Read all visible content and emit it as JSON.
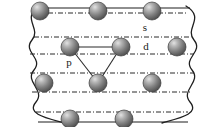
{
  "figure": {
    "background_color": "#ffffff",
    "width": 216,
    "height": 127
  },
  "labels": {
    "s": "s",
    "p": "p",
    "d": "d"
  },
  "label_positions": {
    "s": {
      "x": 145,
      "y": 31
    },
    "p": {
      "x": 69,
      "y": 66
    },
    "d": {
      "x": 146,
      "y": 50
    }
  },
  "colors": {
    "sphere_dark": "#4a4a4a",
    "sphere_mid": "#7d7d7d",
    "sphere_light": "#c8c8c8",
    "sphere_highlight": "#e2e2e2",
    "sphere_outline": "#3c3c3c",
    "level_line": "#2b2b2b",
    "boundary_line": "#1f1f1f",
    "bond_line": "#2b2b2b",
    "label_text": "#1a1a1a"
  },
  "lattice_rows": [
    {
      "name": "row-top",
      "y": 11,
      "spheres": [
        {
          "cx": 40,
          "cy": 11,
          "r": 9
        },
        {
          "cx": 98,
          "cy": 11,
          "r": 9
        },
        {
          "cx": 152,
          "cy": 11,
          "r": 9
        }
      ]
    },
    {
      "name": "row-second",
      "y": 47,
      "spheres": [
        {
          "cx": 70,
          "cy": 47,
          "r": 9
        },
        {
          "cx": 121,
          "cy": 47,
          "r": 9
        },
        {
          "cx": 177,
          "cy": 47,
          "r": 9
        }
      ]
    },
    {
      "name": "row-third",
      "y": 83,
      "spheres": [
        {
          "cx": 44,
          "cy": 83,
          "r": 9
        },
        {
          "cx": 98,
          "cy": 83,
          "r": 9
        },
        {
          "cx": 152,
          "cy": 83,
          "r": 9
        }
      ]
    },
    {
      "name": "row-bottom",
      "y": 119,
      "spheres": [
        {
          "cx": 70,
          "cy": 119,
          "r": 9
        },
        {
          "cx": 124,
          "cy": 119,
          "r": 9
        }
      ]
    }
  ],
  "energy_levels": [
    {
      "name": "level-1",
      "y": 13,
      "x1": 38,
      "x2": 186,
      "style": "dash-dot"
    },
    {
      "name": "level-2",
      "y": 37,
      "x1": 34,
      "x2": 190,
      "style": "dash-dot"
    },
    {
      "name": "level-3",
      "y": 54,
      "x1": 30,
      "x2": 194,
      "style": "dash-dot"
    },
    {
      "name": "level-4",
      "y": 73,
      "x1": 30,
      "x2": 194,
      "style": "dash-dot"
    },
    {
      "name": "level-5",
      "y": 92,
      "x1": 32,
      "x2": 192,
      "style": "dash-dot"
    },
    {
      "name": "level-6",
      "y": 112,
      "x1": 36,
      "x2": 188,
      "style": "dash-dot"
    }
  ],
  "solid_edges": [
    {
      "name": "edge-top",
      "y": 8,
      "x1": 36,
      "x2": 190
    },
    {
      "name": "edge-bottom",
      "y": 122,
      "x1": 38,
      "x2": 188
    }
  ],
  "bonds": [
    {
      "name": "bond-d-horizontal",
      "x1": 70,
      "y1": 47,
      "x2": 121,
      "y2": 47
    },
    {
      "name": "bond-left-diagonal",
      "x1": 70,
      "y1": 47,
      "x2": 98,
      "y2": 83
    },
    {
      "name": "bond-right-diagonal",
      "x1": 121,
      "y1": 47,
      "x2": 98,
      "y2": 83
    }
  ],
  "boundaries": [
    {
      "name": "left-wave",
      "path": "M 40 6 C 20 18, 42 28, 32 40 C 22 52, 44 58, 34 70 C 24 82, 46 90, 36 102 C 26 114, 46 118, 64 123"
    },
    {
      "name": "right-wave",
      "path": "M 186 6 C 206 18, 184 28, 194 40 C 204 52, 182 58, 192 70 C 202 82, 180 90, 190 102 C 200 114, 180 118, 162 123"
    }
  ]
}
